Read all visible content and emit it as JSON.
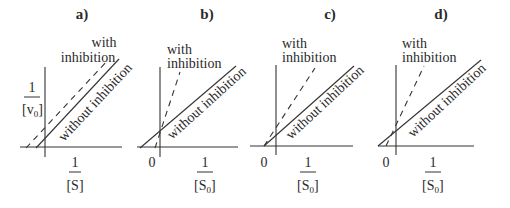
{
  "figure": {
    "panels": [
      {
        "id": "a",
        "title": "a)",
        "with_label_line1": "with",
        "with_label_line2": "inhibition",
        "without_label": "without inhibition",
        "y_axis_num": "1",
        "y_axis_den": "[v",
        "y_axis_den_sub": "0",
        "y_axis_den_close": "]",
        "x_axis_num": "1",
        "x_axis_den": "[S]",
        "origin_label": ""
      },
      {
        "id": "b",
        "title": "b)",
        "with_label_line1": "with",
        "with_label_line2": "inhibition",
        "without_label": "without inhibition",
        "x_axis_num": "1",
        "x_axis_den": "[S",
        "x_axis_den_sub": "0",
        "x_axis_den_close": "]",
        "origin_label": "0"
      },
      {
        "id": "c",
        "title": "c)",
        "with_label_line1": "with",
        "with_label_line2": "inhibition",
        "without_label": "without inhibition",
        "x_axis_num": "1",
        "x_axis_den": "[S",
        "x_axis_den_sub": "0",
        "x_axis_den_close": "]",
        "origin_label": "0"
      },
      {
        "id": "d",
        "title": "d)",
        "with_label_line1": "with",
        "with_label_line2": "inhibition",
        "without_label": "without inhibition",
        "x_axis_num": "1",
        "x_axis_den": "[S",
        "x_axis_den_sub": "0",
        "x_axis_den_close": "]",
        "origin_label": "0"
      }
    ]
  }
}
